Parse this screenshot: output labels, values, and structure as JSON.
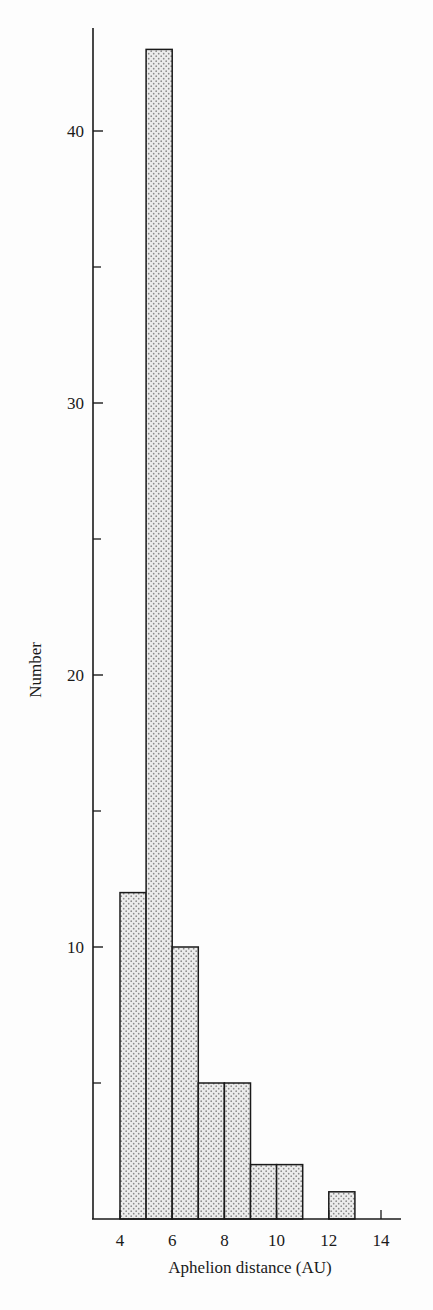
{
  "chart_data": {
    "type": "bar",
    "subtype": "histogram",
    "title": "",
    "xlabel": "Aphelion distance (AU)",
    "ylabel": "Number",
    "bins": [
      {
        "start": 4,
        "end": 5,
        "value": 12
      },
      {
        "start": 5,
        "end": 6,
        "value": 43
      },
      {
        "start": 6,
        "end": 7,
        "value": 10
      },
      {
        "start": 7,
        "end": 8,
        "value": 5
      },
      {
        "start": 8,
        "end": 9,
        "value": 5
      },
      {
        "start": 9,
        "end": 10,
        "value": 2
      },
      {
        "start": 10,
        "end": 11,
        "value": 2
      },
      {
        "start": 11,
        "end": 12,
        "value": 0
      },
      {
        "start": 12,
        "end": 13,
        "value": 1
      },
      {
        "start": 13,
        "end": 14,
        "value": 0
      }
    ],
    "categories": [
      "4-5",
      "5-6",
      "6-7",
      "7-8",
      "8-9",
      "9-10",
      "10-11",
      "11-12",
      "12-13",
      "13-14"
    ],
    "values": [
      12,
      43,
      10,
      5,
      5,
      2,
      2,
      0,
      1,
      0
    ],
    "x_ticks": [
      4,
      6,
      8,
      10,
      12,
      14
    ],
    "y_ticks_labeled": [
      10,
      20,
      30,
      40
    ],
    "y_ticks_minor": [
      5,
      15,
      25,
      35
    ],
    "xlim": [
      3,
      15
    ],
    "ylim": [
      0,
      46
    ],
    "grid": false,
    "legend": null,
    "fill": "stippled",
    "colors": {
      "bar_fill": "#e9e9e9",
      "stipple": "#8a8a8a",
      "line": "#1a1a1a"
    }
  }
}
